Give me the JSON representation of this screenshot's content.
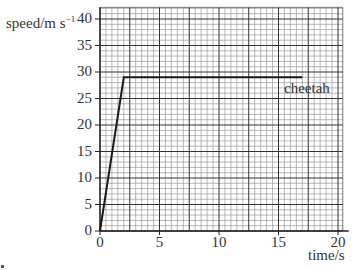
{
  "chart_data": {
    "type": "line",
    "title": "",
    "xlabel": "time/s",
    "ylabel": "speed/m s⁻¹",
    "ylabel_parts": {
      "base": "speed/m s",
      "sup": "−1"
    },
    "xlim": [
      0,
      20
    ],
    "ylim": [
      0,
      40
    ],
    "x_ticks": [
      0,
      5,
      10,
      15,
      20
    ],
    "y_ticks": [
      0,
      5,
      10,
      15,
      20,
      25,
      30,
      35,
      40
    ],
    "x_tick_labels": [
      "0",
      "5",
      "10",
      "15",
      "20"
    ],
    "y_tick_labels": [
      "0",
      "5",
      "10",
      "15",
      "20",
      "25",
      "30",
      "35",
      "40"
    ],
    "grid": {
      "on": true,
      "major_x": 2.5,
      "major_y": 5,
      "minor_x": 0.5,
      "minor_y": 1
    },
    "series": [
      {
        "name": "cheetah",
        "x": [
          0,
          2,
          17
        ],
        "y": [
          0,
          29,
          29
        ]
      }
    ],
    "annotations": [
      {
        "text": "cheetah",
        "x": 17,
        "y": 27
      }
    ],
    "legend": "none"
  },
  "labels": {
    "ylabel": "speed/m s",
    "ylabel_sup": "−1",
    "xlabel": "time/s",
    "series_label": "cheetah"
  }
}
